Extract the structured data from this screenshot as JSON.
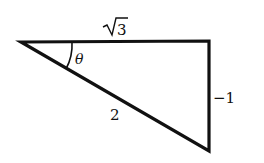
{
  "diagram": {
    "type": "right-triangle",
    "labels": {
      "adjacent": "3",
      "adjacent_display": "√3",
      "hypotenuse": "2",
      "opposite": "−1",
      "angle": "θ"
    },
    "colors": {
      "stroke": "#111111",
      "background": "#ffffff"
    }
  }
}
